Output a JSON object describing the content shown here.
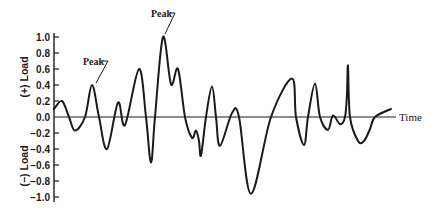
{
  "chart_data": {
    "type": "line",
    "title": "",
    "xlabel": "Time",
    "ylabel_positive": "(+) Load",
    "ylabel_negative": "(−) Load",
    "ylim": [
      -1.0,
      1.0
    ],
    "yticks": [
      1.0,
      0.8,
      0.6,
      0.4,
      0.2,
      0.0,
      -0.2,
      -0.4,
      -0.6,
      -0.8,
      -1.0
    ],
    "ytick_labels": [
      "1.0",
      "0.8",
      "0.6",
      "0.4",
      "0.2",
      "0.0",
      "−0.2",
      "−0.4",
      "−0.6",
      "−0.8",
      "−1.0"
    ],
    "grid": false,
    "legend": null,
    "series": [
      {
        "name": "Load",
        "x": [
          0,
          8,
          15,
          21,
          31,
          38,
          45,
          53,
          64,
          71,
          85,
          92,
          97,
          101,
          109,
          117,
          124,
          131,
          138,
          142,
          145,
          147,
          152,
          158,
          162,
          166,
          178,
          185,
          197,
          217,
          238,
          242,
          250,
          254,
          261,
          266,
          274,
          279,
          286,
          291,
          293,
          294,
          296,
          304,
          310,
          316,
          321,
          337
        ],
        "y": [
          0.1,
          0.2,
          0.0,
          -0.17,
          0.0,
          0.4,
          0.0,
          -0.4,
          0.18,
          -0.1,
          0.6,
          0.0,
          -0.57,
          0.0,
          1.0,
          0.41,
          0.6,
          0.0,
          -0.26,
          -0.17,
          -0.3,
          -0.48,
          0.0,
          0.38,
          0.0,
          -0.36,
          0.05,
          0.0,
          -0.96,
          0.0,
          0.48,
          0.0,
          -0.35,
          0.0,
          0.42,
          0.0,
          -0.16,
          0.02,
          -0.09,
          0.0,
          0.3,
          0.64,
          0.0,
          -0.3,
          -0.3,
          -0.15,
          0.0,
          0.1
        ]
      }
    ],
    "annotations": [
      {
        "text": "Peak",
        "target_x": 109,
        "target_y": 1.0
      },
      {
        "text": "Peak",
        "target_x": 38,
        "target_y": 0.4
      }
    ]
  },
  "labels": {
    "peak_top": "Peak",
    "peak_left": "Peak",
    "time": "Time",
    "load_pos": "(+) Load",
    "load_neg": "(−) Load"
  }
}
